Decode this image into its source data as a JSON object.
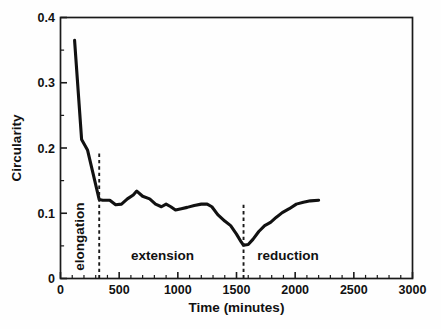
{
  "chart_data": {
    "type": "line",
    "title": "",
    "xlabel": "Time (minutes)",
    "ylabel": "Circularity",
    "xlim": [
      0,
      3000
    ],
    "ylim": [
      0,
      0.4
    ],
    "xticks": [
      0,
      500,
      1000,
      1500,
      2000,
      2500,
      3000
    ],
    "xticklabels": [
      "0",
      "500",
      "1000",
      "1500",
      "2000",
      "2500",
      "3000"
    ],
    "yticks": [
      0,
      0.1,
      0.2,
      0.3,
      0.4
    ],
    "yticklabels": [
      "0",
      "0.1",
      "0.2",
      "0.3",
      "0.4"
    ],
    "x_minor_interval": 100,
    "y_minor_interval": 0.05,
    "grid": false,
    "legend": null,
    "series": [
      {
        "name": "Circularity",
        "color": "#111111",
        "x": [
          120,
          180,
          230,
          330,
          360,
          420,
          470,
          520,
          570,
          620,
          650,
          700,
          760,
          810,
          860,
          900,
          940,
          980,
          1030,
          1080,
          1140,
          1200,
          1250,
          1290,
          1340,
          1400,
          1450,
          1500,
          1540,
          1560,
          1600,
          1640,
          1690,
          1740,
          1790,
          1840,
          1890,
          1950,
          2010,
          2070,
          2130,
          2200
        ],
        "y": [
          0.365,
          0.213,
          0.197,
          0.121,
          0.12,
          0.12,
          0.113,
          0.114,
          0.122,
          0.128,
          0.134,
          0.126,
          0.122,
          0.114,
          0.11,
          0.114,
          0.11,
          0.105,
          0.107,
          0.109,
          0.112,
          0.114,
          0.114,
          0.11,
          0.098,
          0.088,
          0.081,
          0.068,
          0.056,
          0.051,
          0.052,
          0.06,
          0.072,
          0.081,
          0.086,
          0.094,
          0.101,
          0.107,
          0.114,
          0.117,
          0.119,
          0.12
        ]
      }
    ],
    "annotations": [
      {
        "name": "elongation",
        "label": "elongation",
        "x": 200,
        "rotation": -90
      },
      {
        "name": "extension",
        "label": "extension",
        "x": 870,
        "rotation": 0
      },
      {
        "name": "reduction",
        "label": "reduction",
        "x": 1940,
        "rotation": 0
      }
    ],
    "vertical_dividers": [
      {
        "name": "elongation-extension-divider",
        "x": 330,
        "y_from": 0.0,
        "y_to": 0.195
      },
      {
        "name": "extension-reduction-divider",
        "x": 1560,
        "y_from": 0.0,
        "y_to": 0.115
      }
    ]
  },
  "style": {
    "curve_color": "#111111",
    "axis_color": "#1a1a1a",
    "background": "#ffffff"
  }
}
